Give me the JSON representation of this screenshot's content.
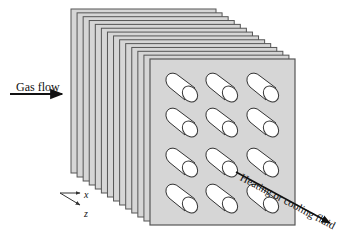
{
  "diagram": {
    "labels": {
      "gas_flow": "Gas flow",
      "fluid": "Heating or cooling fluid",
      "axis_x": "x",
      "axis_z": "z"
    },
    "plates": {
      "count": 14,
      "back": {
        "x": 71,
        "y": 9,
        "w": 145,
        "h": 164
      },
      "front": {
        "x": 150,
        "y": 59,
        "w": 145,
        "h": 166
      },
      "fill": "#d6d6d6",
      "edge": "#555555"
    },
    "tubes": {
      "rows": 4,
      "cols": 3,
      "col_x": [
        182,
        222,
        263
      ],
      "row_y": [
        88,
        123,
        163,
        199
      ],
      "fill": "#ffffff",
      "stroke": "#333333"
    },
    "arrows": {
      "gas_flow": {
        "x1": 10,
        "y1": 94,
        "x2": 62,
        "y2": 94
      },
      "fluid": {
        "x1": 236,
        "y1": 172,
        "x2": 330,
        "y2": 223
      }
    }
  }
}
